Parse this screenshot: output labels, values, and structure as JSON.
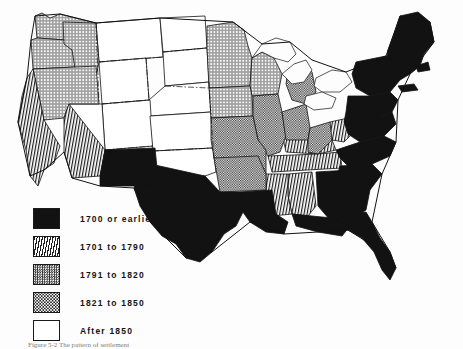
{
  "figure": {
    "caption_partial": "Figure 5-2  The pattern of settlement",
    "background_color": "#fdfdfd",
    "ink_color": "#121212"
  },
  "legend": {
    "name": "settlement-date-legend",
    "items": [
      {
        "label": "1700 or earlier",
        "pattern": "solid-black",
        "swatch_class": "sw-solid"
      },
      {
        "label": "1701 to 1790",
        "pattern": "diagonal-hatch",
        "swatch_class": "sw-hatch"
      },
      {
        "label": "1791 to 1820",
        "pattern": "fine-checker",
        "swatch_class": "sw-checker"
      },
      {
        "label": "1821 to 1850",
        "pattern": "circle-dots",
        "swatch_class": "sw-dots"
      },
      {
        "label": "After 1850",
        "pattern": "white-blank",
        "swatch_class": "sw-white"
      }
    ]
  },
  "map": {
    "name": "united-states-choropleth",
    "projection": "conic",
    "regions": {
      "solid-black": [
        "Maine",
        "New Hampshire",
        "Vermont",
        "Massachusetts",
        "Rhode Island",
        "Connecticut",
        "New York",
        "New Jersey",
        "Pennsylvania",
        "Delaware",
        "Maryland",
        "Virginia",
        "North Carolina",
        "South Carolina",
        "Georgia",
        "Florida",
        "Louisiana",
        "Texas",
        "New Mexico"
      ],
      "diagonal-hatch": [
        "California",
        "Arizona",
        "Tennessee",
        "Kentucky",
        "Alabama",
        "Mississippi",
        "West Virginia"
      ],
      "fine-checker": [
        "Ohio",
        "Indiana",
        "Illinois",
        "Missouri",
        "Arkansas",
        "Michigan",
        "Iowa",
        "Wisconsin-south"
      ],
      "circle-dots": [
        "Washington",
        "Oregon",
        "Idaho",
        "Nevada",
        "Minnesota",
        "Wisconsin",
        "Utah-north"
      ],
      "white-blank": [
        "Montana",
        "Wyoming",
        "Colorado",
        "North Dakota",
        "South Dakota",
        "Nebraska",
        "Kansas",
        "Oklahoma",
        "Utah"
      ]
    }
  }
}
